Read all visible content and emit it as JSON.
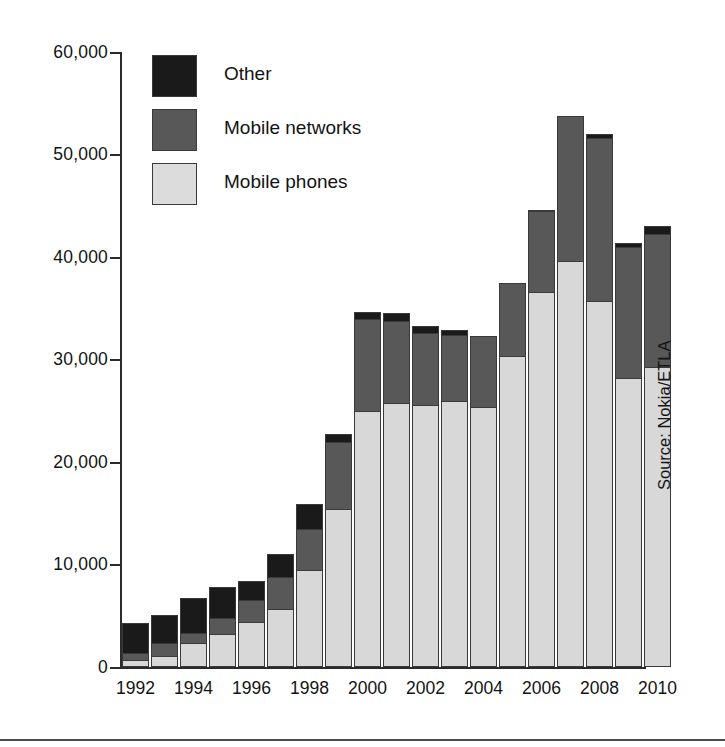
{
  "chart_data": {
    "type": "bar",
    "title": "",
    "subtitle": "",
    "xlabel": "",
    "ylabel": "",
    "stacked": true,
    "grid": false,
    "ylim": [
      0,
      60000
    ],
    "ytick_values": [
      0,
      10000,
      20000,
      30000,
      40000,
      50000,
      60000
    ],
    "ytick_labels": [
      "0",
      "10,000",
      "20,000",
      "30,000",
      "40,000",
      "50,000",
      "60,000"
    ],
    "x": [
      1992,
      1993,
      1994,
      1995,
      1996,
      1997,
      1998,
      1999,
      2000,
      2001,
      2002,
      2003,
      2004,
      2005,
      2006,
      2007,
      2008,
      2009,
      2010
    ],
    "categories": [
      "1992",
      "1993",
      "1994",
      "1995",
      "1996",
      "1997",
      "1998",
      "1999",
      "2000",
      "2001",
      "2002",
      "2003",
      "2004",
      "2005",
      "2006",
      "2007",
      "2008",
      "2009",
      "2010"
    ],
    "xtick_labels_shown": [
      "1992",
      "1994",
      "1996",
      "1998",
      "2000",
      "2002",
      "2004",
      "2006",
      "2008",
      "2010"
    ],
    "legend_position": "upper-left-inside",
    "series": [
      {
        "name": "Mobile phones",
        "color": "#d8d8d8",
        "values": [
          700,
          1100,
          2300,
          3200,
          4400,
          5700,
          9500,
          15400,
          25000,
          25800,
          25600,
          26000,
          25400,
          30300,
          36600,
          39600,
          35700,
          28200,
          29300
        ]
      },
      {
        "name": "Mobile networks",
        "color": "#585858",
        "values": [
          700,
          1200,
          1000,
          1600,
          2100,
          3100,
          4000,
          6600,
          9000,
          8000,
          7000,
          6400,
          6900,
          7200,
          7900,
          14200,
          15900,
          12800,
          12900
        ]
      },
      {
        "name": "Other",
        "color": "#1a1a1a",
        "values": [
          2900,
          2800,
          3400,
          3000,
          1900,
          2200,
          2400,
          700,
          600,
          700,
          700,
          500,
          0,
          0,
          100,
          0,
          400,
          400,
          800
        ]
      }
    ],
    "totals": [
      4300,
      5100,
      6700,
      7800,
      8400,
      11000,
      15900,
      22700,
      34600,
      34500,
      33300,
      32900,
      32300,
      37500,
      44600,
      53800,
      52000,
      41400,
      43000
    ],
    "annotations": [
      "Source: Nokia/ETLA"
    ]
  },
  "legend": {
    "items": [
      {
        "label": "Other",
        "color": "#1a1a1a",
        "swatch": "legend-swatch-other"
      },
      {
        "label": "Mobile networks",
        "color": "#585858",
        "swatch": "legend-swatch-networks"
      },
      {
        "label": "Mobile phones",
        "color": "#dcdcdc",
        "swatch": "legend-swatch-phones"
      }
    ]
  },
  "source_note": "Source: Nokia/ETLA"
}
